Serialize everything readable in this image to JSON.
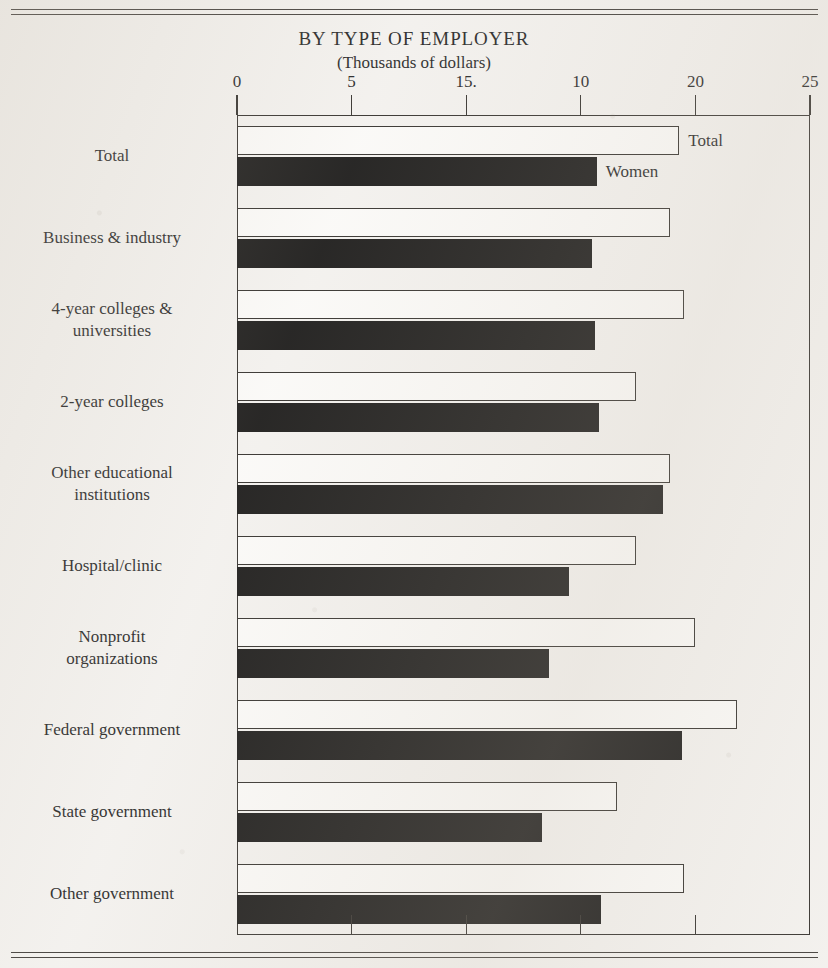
{
  "title": "BY TYPE OF EMPLOYER",
  "subtitle": "(Thousands of dollars)",
  "legend": {
    "total_label": "Total",
    "women_label": "Women"
  },
  "axis": {
    "tick_labels": [
      "0",
      "5",
      "15.",
      "10",
      "20",
      "25"
    ],
    "tick_values": [
      0,
      5,
      10,
      15,
      20,
      25
    ]
  },
  "categories": [
    {
      "lines": [
        "Total"
      ]
    },
    {
      "lines": [
        "Business & industry"
      ]
    },
    {
      "lines": [
        "4-year colleges &",
        "universities"
      ]
    },
    {
      "lines": [
        "2-year colleges"
      ]
    },
    {
      "lines": [
        "Other educational",
        "institutions"
      ]
    },
    {
      "lines": [
        "Hospital/clinic"
      ]
    },
    {
      "lines": [
        "Nonprofit",
        "organizations"
      ]
    },
    {
      "lines": [
        "Federal government"
      ]
    },
    {
      "lines": [
        "State government"
      ]
    },
    {
      "lines": [
        "Other government"
      ]
    }
  ],
  "chart_data": {
    "type": "bar",
    "orientation": "horizontal",
    "title": "BY TYPE OF EMPLOYER",
    "subtitle": "(Thousands of dollars)",
    "xlabel": "",
    "ylabel": "",
    "xlim": [
      0,
      25
    ],
    "grid": false,
    "legend_position": "inline-first-group",
    "xticks": [
      0,
      5,
      10,
      15,
      20,
      25
    ],
    "xticklabels": [
      "0",
      "5",
      "15.",
      "10",
      "20",
      "25"
    ],
    "categories": [
      "Total",
      "Business & industry",
      "4-year colleges & universities",
      "2-year colleges",
      "Other educational institutions",
      "Hospital/clinic",
      "Nonprofit organizations",
      "Federal government",
      "State government",
      "Other government"
    ],
    "series": [
      {
        "name": "Total",
        "style": "hollow",
        "color": "#ffffff",
        "values": [
          19.3,
          18.9,
          19.5,
          17.4,
          18.9,
          17.4,
          20.0,
          21.8,
          16.6,
          19.5
        ]
      },
      {
        "name": "Women",
        "style": "filled",
        "color": "#121110",
        "values": [
          15.7,
          15.5,
          15.6,
          15.8,
          18.6,
          14.5,
          13.6,
          19.4,
          13.3,
          15.9
        ]
      }
    ]
  }
}
